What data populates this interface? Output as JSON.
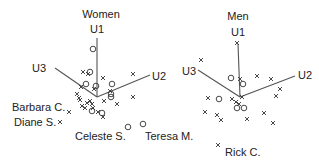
{
  "chart_data": [
    {
      "type": "scatter",
      "title": "Women",
      "axes": [
        "U1",
        "U2",
        "U3"
      ],
      "projection": "3D biplot-style axes",
      "legend": [
        {
          "marker": "circle",
          "meaning": "group o"
        },
        {
          "marker": "x",
          "meaning": "group x"
        }
      ],
      "annotations": [
        "Barbara C.",
        "Diane S.",
        "Celeste S.",
        "Teresa M."
      ],
      "points_px": {
        "circle": [
          [
            93,
            49
          ],
          [
            90,
            72
          ],
          [
            86,
            84
          ],
          [
            96,
            86
          ],
          [
            112,
            84
          ],
          [
            111,
            94
          ],
          [
            111,
            97
          ],
          [
            92,
            111
          ],
          [
            102,
            113
          ],
          [
            128,
            127
          ],
          [
            143,
            124
          ]
        ],
        "x": [
          [
            83,
            72
          ],
          [
            88,
            74
          ],
          [
            103,
            78
          ],
          [
            133,
            74
          ],
          [
            81,
            87
          ],
          [
            94,
            89
          ],
          [
            110,
            91
          ],
          [
            77,
            94
          ],
          [
            79,
            98
          ],
          [
            80,
            100
          ],
          [
            87,
            103
          ],
          [
            90,
            101
          ],
          [
            92,
            104
          ],
          [
            104,
            101
          ],
          [
            117,
            104
          ],
          [
            133,
            97
          ],
          [
            82,
            106
          ],
          [
            85,
            108
          ],
          [
            93,
            108
          ],
          [
            69,
            112
          ],
          [
            98,
            112
          ],
          [
            103,
            117
          ],
          [
            60,
            122
          ]
        ]
      }
    },
    {
      "type": "scatter",
      "title": "Men",
      "axes": [
        "U1",
        "U2",
        "U3"
      ],
      "projection": "3D biplot-style axes",
      "annotations": [
        "Rick C."
      ],
      "points_px": {
        "circle": [
          [
            231,
            78
          ],
          [
            243,
            84
          ],
          [
            219,
            99
          ],
          [
            237,
            108
          ],
          [
            244,
            108
          ]
        ],
        "x": [
          [
            237,
            43
          ],
          [
            201,
            60
          ],
          [
            240,
            79
          ],
          [
            257,
            76
          ],
          [
            271,
            79
          ],
          [
            280,
            89
          ],
          [
            276,
            96
          ],
          [
            208,
            98
          ],
          [
            232,
            99
          ],
          [
            236,
            102
          ],
          [
            239,
            104
          ],
          [
            242,
            97
          ],
          [
            205,
            112
          ],
          [
            217,
            115
          ],
          [
            221,
            120
          ],
          [
            247,
            119
          ],
          [
            264,
            113
          ],
          [
            273,
            123
          ],
          [
            218,
            145
          ]
        ]
      }
    }
  ],
  "women": {
    "title": "Women",
    "u1": "U1",
    "u2": "U2",
    "u3": "U3",
    "labels": {
      "barbara": "Barbara C.",
      "diane": "Diane S.",
      "celeste": "Celeste S.",
      "teresa": "Teresa M."
    }
  },
  "men": {
    "title": "Men",
    "u1": "U1",
    "u2": "U2",
    "u3": "U3",
    "labels": {
      "rick": "Rick C."
    }
  }
}
